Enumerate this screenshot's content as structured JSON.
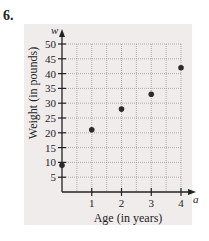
{
  "problem": {
    "number": "6."
  },
  "chart_data": {
    "type": "scatter",
    "title": "",
    "xlabel": "Age (in years)",
    "ylabel": "Weight (in pounds)",
    "x_axis_variable": "a",
    "y_axis_variable": "w",
    "x": [
      0,
      1,
      2,
      3,
      4
    ],
    "y": [
      9,
      21,
      28,
      33,
      42
    ],
    "points": [
      {
        "a": 0,
        "w": 9
      },
      {
        "a": 1,
        "w": 21
      },
      {
        "a": 2,
        "w": 28
      },
      {
        "a": 3,
        "w": 33
      },
      {
        "a": 4,
        "w": 42
      }
    ],
    "xlim": [
      0,
      4.3
    ],
    "ylim": [
      0,
      53
    ],
    "x_ticks": [
      1,
      2,
      3,
      4
    ],
    "y_ticks": [
      5,
      10,
      15,
      20,
      25,
      30,
      35,
      40,
      45,
      50
    ],
    "grid": true,
    "grid_x_step": 0.5,
    "grid_y_step": 5,
    "legend": null
  },
  "colors": {
    "panel_bg": "#f1ecec",
    "grid": "#9a9a9a",
    "axis": "#222222",
    "point": "#2b2b2b"
  }
}
